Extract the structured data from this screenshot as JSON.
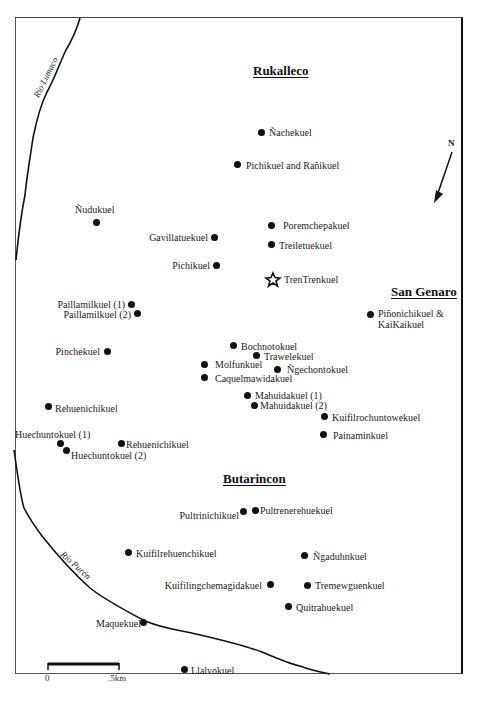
{
  "map": {
    "regions": [
      {
        "name": "Rukalleco",
        "x": 253,
        "y": 63
      },
      {
        "name": "San Genaro",
        "x": 391,
        "y": 284
      },
      {
        "name": "Butarincon",
        "x": 223,
        "y": 471
      }
    ],
    "rivers": [
      {
        "name": "Río Lumaco",
        "x": 36,
        "y": 92,
        "angle": -64
      },
      {
        "name": "Río Purén",
        "x": 62,
        "y": 548,
        "angle": 42
      }
    ],
    "north_arrow": {
      "label": "N"
    },
    "scale_bar": {
      "start_label": "0",
      "end_label": ".5km"
    },
    "sites": [
      {
        "name": "Ñachekuel",
        "dot_x": 261,
        "dot_y": 133,
        "label_side": "right"
      },
      {
        "name": "Pichikuel and Rañikuel",
        "dot_x": 238,
        "dot_y": 165,
        "label_side": "right"
      },
      {
        "name": "Ñudukuel",
        "dot_x": 96,
        "dot_y": 223,
        "label_side": "above"
      },
      {
        "name": "Gavillatuekuel",
        "dot_x": 214,
        "dot_y": 238,
        "label_side": "left"
      },
      {
        "name": "Poremchepakuel",
        "dot_x": 271,
        "dot_y": 226,
        "label_side": "right"
      },
      {
        "name": "Treiletuekuel",
        "dot_x": 271,
        "dot_y": 245,
        "label_side": "right"
      },
      {
        "name": "Pichikuel",
        "dot_x": 216,
        "dot_y": 266,
        "label_side": "left"
      },
      {
        "name": "TrenTrenkuel",
        "dot_x": 273,
        "dot_y": 279,
        "label_side": "right",
        "marker": "star"
      },
      {
        "name": "Piñonichikuel & KaiKaikuel",
        "dot_x": 370,
        "dot_y": 315,
        "label_side": "right"
      },
      {
        "name": "Paillamilkuel (1)",
        "dot_x": 131,
        "dot_y": 305,
        "label_side": "left"
      },
      {
        "name": "Paillamilkuel (2)",
        "dot_x": 137,
        "dot_y": 314,
        "label_side": "left"
      },
      {
        "name": "Pinchekuel",
        "dot_x": 107,
        "dot_y": 352,
        "label_side": "left"
      },
      {
        "name": "Bochnotokuel",
        "dot_x": 233,
        "dot_y": 346,
        "label_side": "right"
      },
      {
        "name": "Trawelekuel",
        "dot_x": 256,
        "dot_y": 356,
        "label_side": "right"
      },
      {
        "name": "Molfunkuel",
        "dot_x": 204,
        "dot_y": 365,
        "label_side": "right"
      },
      {
        "name": "Ñgechontokuel",
        "dot_x": 277,
        "dot_y": 370,
        "label_side": "right"
      },
      {
        "name": "Caquelmawidakuel",
        "dot_x": 204,
        "dot_y": 378,
        "label_side": "right"
      },
      {
        "name": "Mahuidakuel (1)",
        "dot_x": 247,
        "dot_y": 396,
        "label_side": "right"
      },
      {
        "name": "Mahuidakuel (2)",
        "dot_x": 254,
        "dot_y": 406,
        "label_side": "right"
      },
      {
        "name": "Kuifilrochuntowekuel",
        "dot_x": 324,
        "dot_y": 417,
        "label_side": "right"
      },
      {
        "name": "Painaminkuel",
        "dot_x": 323,
        "dot_y": 435,
        "label_side": "right"
      },
      {
        "name": "Rehuenichikuel",
        "dot_x": 48,
        "dot_y": 407,
        "label_side": "right"
      },
      {
        "name": "Huechuntokuel (1)",
        "dot_x": 60,
        "dot_y": 444,
        "label_side": "above-left"
      },
      {
        "name": "Huechuntokuel (2)",
        "dot_x": 66,
        "dot_y": 451,
        "label_side": "right"
      },
      {
        "name": "Rehuenichikuel",
        "dot_x": 121,
        "dot_y": 444,
        "label_side": "right"
      },
      {
        "name": "Pultrinichikuel",
        "dot_x": 243,
        "dot_y": 512,
        "label_side": "left"
      },
      {
        "name": "Pultrenerehuekuel",
        "dot_x": 255,
        "dot_y": 511,
        "label_side": "right"
      },
      {
        "name": "Kuifilrehuenchikuel",
        "dot_x": 128,
        "dot_y": 553,
        "label_side": "right"
      },
      {
        "name": "Ñgaduhnkuel",
        "dot_x": 304,
        "dot_y": 556,
        "label_side": "right"
      },
      {
        "name": "Kuifilingchemagidakuel",
        "dot_x": 270,
        "dot_y": 585,
        "label_side": "left"
      },
      {
        "name": "Tremewguenkuel",
        "dot_x": 307,
        "dot_y": 586,
        "label_side": "right"
      },
      {
        "name": "Quitrahuekuel",
        "dot_x": 288,
        "dot_y": 607,
        "label_side": "right"
      },
      {
        "name": "Maquekuel",
        "dot_x": 143,
        "dot_y": 623,
        "label_side": "left"
      },
      {
        "name": "Llalvokuel",
        "dot_x": 184,
        "dot_y": 670,
        "label_side": "right"
      }
    ]
  }
}
